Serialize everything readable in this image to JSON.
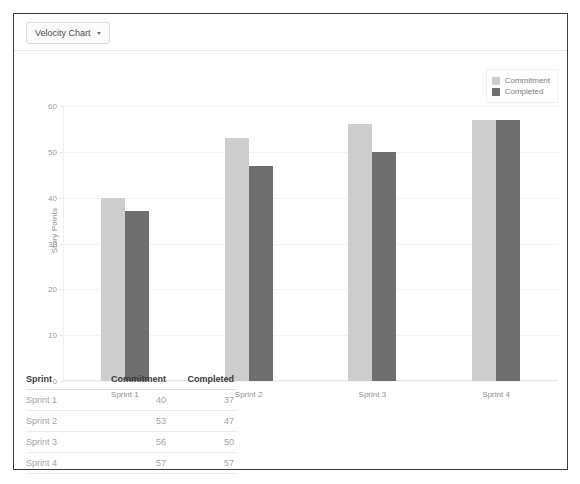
{
  "header": {
    "select_label": "Velocity Chart",
    "caret_icon": "chevron-down-icon",
    "caret_glyph": "▾"
  },
  "legend": {
    "position": "top-right",
    "items": [
      {
        "label": "Commitment",
        "color": "#cdcdcd"
      },
      {
        "label": "Completed",
        "color": "#6f6f6f"
      }
    ]
  },
  "chart_data": {
    "type": "bar",
    "title": "",
    "xlabel": "",
    "ylabel": "Story Points",
    "categories": [
      "Sprint 1",
      "Sprint 2",
      "Sprint 3",
      "Sprint 4"
    ],
    "series": [
      {
        "name": "Commitment",
        "color": "#cdcdcd",
        "values": [
          40,
          53,
          56,
          57
        ]
      },
      {
        "name": "Completed",
        "color": "#6f6f6f",
        "values": [
          37,
          47,
          50,
          57
        ]
      }
    ],
    "ylim": [
      0,
      60
    ],
    "yticks": [
      0,
      10,
      20,
      30,
      40,
      50,
      60
    ],
    "ytick_labels": [
      "0",
      "10",
      "20",
      "30",
      "40",
      "50",
      "60"
    ],
    "grid": true,
    "legend_position": "top-right"
  },
  "table": {
    "columns": [
      "Sprint",
      "Commitment",
      "Completed"
    ],
    "rows": [
      {
        "sprint": "Sprint 1",
        "commitment": "40",
        "completed": "37"
      },
      {
        "sprint": "Sprint 2",
        "commitment": "53",
        "completed": "47"
      },
      {
        "sprint": "Sprint 3",
        "commitment": "56",
        "completed": "50"
      },
      {
        "sprint": "Sprint 4",
        "commitment": "57",
        "completed": "57"
      }
    ]
  }
}
